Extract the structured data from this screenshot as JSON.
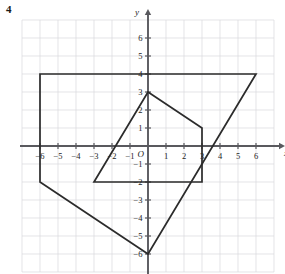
{
  "question_number": "4",
  "axes": {
    "x_axis_label": "x",
    "y_axis_label": "y",
    "origin_label": "O",
    "x_tick_labels": [
      "−6",
      "−5",
      "−4",
      "−3",
      "−2",
      "−1",
      "1",
      "2",
      "3",
      "4",
      "5",
      "6"
    ],
    "y_tick_labels": [
      "6",
      "5",
      "4",
      "3",
      "2",
      "1",
      "−1",
      "−2",
      "−3",
      "−4",
      "−5",
      "−6"
    ],
    "x_range": [
      -7,
      7
    ],
    "y_range": [
      -7,
      7
    ],
    "grid": "on",
    "grid_color": "#d8d8dc",
    "axis_color": "#59595e"
  },
  "chart_data": {
    "type": "scatter",
    "title": "",
    "xlabel": "x",
    "ylabel": "y",
    "xlim": [
      -7,
      7
    ],
    "ylim": [
      -7,
      7
    ],
    "grid": true,
    "legend": "none",
    "shape_color": "#2b2b2b",
    "series": [
      {
        "name": "large-quadrilateral",
        "closed": true,
        "vertices": [
          [
            -6,
            4
          ],
          [
            6,
            4
          ],
          [
            0,
            -6
          ],
          [
            -6,
            -2
          ]
        ]
      },
      {
        "name": "small-quadrilateral",
        "closed": true,
        "vertices": [
          [
            0,
            3
          ],
          [
            3,
            1
          ],
          [
            3,
            -2
          ],
          [
            -3,
            -2
          ]
        ]
      }
    ]
  }
}
